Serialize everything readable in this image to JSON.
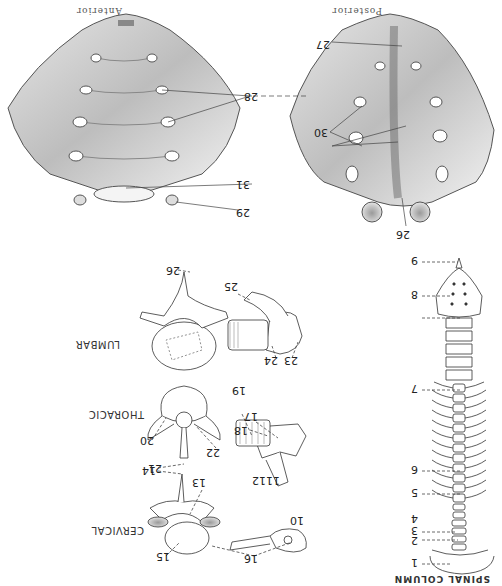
{
  "figure": {
    "orientation": "rotated-180",
    "title": "SPINAL COLUMN",
    "sacrum": {
      "posterior_caption": "Posterior",
      "anterior_caption": "Anterior",
      "labels": {
        "l26": "26",
        "l27": "27",
        "l28": "28",
        "l29": "29",
        "l30": "30",
        "l31": "31"
      }
    },
    "column_labels": {
      "l1": "1",
      "l2": "2",
      "l3": "3",
      "l4": "4",
      "l5": "5",
      "l6": "6",
      "l7": "7",
      "l8": "8",
      "l9": "9"
    },
    "vertebrae": {
      "cervical": {
        "name": "CERVICAL",
        "labels": {
          "l10": "10",
          "l11": "11",
          "l12": "12",
          "l13": "13",
          "l14": "14",
          "l15": "15",
          "l16": "16"
        }
      },
      "thoracic": {
        "name": "THORACIC",
        "labels": {
          "l17": "17",
          "l18": "18",
          "l19": "19",
          "l20": "20",
          "l21": "21",
          "l22": "22"
        }
      },
      "lumbar": {
        "name": "LUMBAR",
        "labels": {
          "l23": "23",
          "l24": "24",
          "l25": "25",
          "l26": "26"
        }
      }
    }
  }
}
